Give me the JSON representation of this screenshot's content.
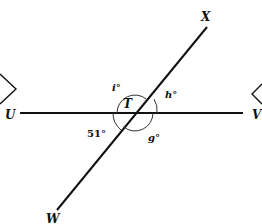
{
  "diagram": {
    "type": "intersecting-lines-angles",
    "points": {
      "U": "U",
      "V": "V",
      "X": "X",
      "W": "W",
      "T": "T"
    },
    "angles": {
      "i": "i°",
      "h": "h°",
      "g": "g°",
      "given": "51°"
    },
    "lines": [
      {
        "name": "UV",
        "from": "U",
        "to": "V",
        "orientation": "horizontal"
      },
      {
        "name": "WX",
        "from": "W",
        "to": "X",
        "through": "T"
      }
    ],
    "intersection": "T",
    "colors": {
      "stroke": "#111111",
      "background": "#ffffff"
    }
  }
}
